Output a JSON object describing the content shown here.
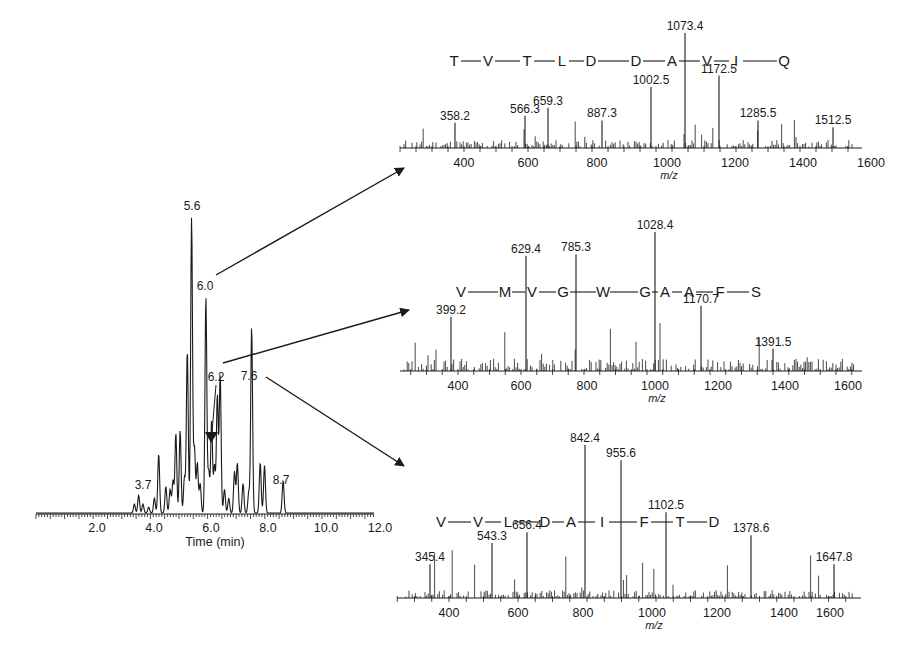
{
  "colors": {
    "ink": "#1a1a1a",
    "background": "#ffffff"
  },
  "chart_data": [
    {
      "id": "chromatogram",
      "type": "line",
      "title": "",
      "xlabel": "Time (min)",
      "ylabel": "",
      "xlim": [
        0,
        12.0
      ],
      "x_ticks": [
        "2.0",
        "4.0",
        "6.0",
        "8.0",
        "10.0",
        "12.0"
      ],
      "grid": false,
      "annotations": [
        "3.7",
        "5.6",
        "6.0",
        "6.2",
        "7.6",
        "8.7"
      ],
      "peaks": [
        {
          "t": 3.3,
          "h": 3
        },
        {
          "t": 3.45,
          "h": 6
        },
        {
          "t": 3.6,
          "h": 3
        },
        {
          "t": 3.8,
          "h": 2
        },
        {
          "t": 4.0,
          "h": 5
        },
        {
          "t": 4.15,
          "h": 20
        },
        {
          "t": 4.4,
          "h": 9
        },
        {
          "t": 4.55,
          "h": 8
        },
        {
          "t": 4.65,
          "h": 11
        },
        {
          "t": 4.75,
          "h": 27
        },
        {
          "t": 4.9,
          "h": 28
        },
        {
          "t": 5.05,
          "h": 12
        },
        {
          "t": 5.15,
          "h": 55
        },
        {
          "t": 5.3,
          "h": 100
        },
        {
          "t": 5.4,
          "h": 22
        },
        {
          "t": 5.5,
          "h": 17
        },
        {
          "t": 5.6,
          "h": 10
        },
        {
          "t": 5.8,
          "h": 73
        },
        {
          "t": 5.9,
          "h": 14
        },
        {
          "t": 6.0,
          "h": 31
        },
        {
          "t": 6.1,
          "h": 16
        },
        {
          "t": 6.2,
          "h": 40
        },
        {
          "t": 6.3,
          "h": 47
        },
        {
          "t": 6.45,
          "h": 8
        },
        {
          "t": 6.6,
          "h": 5
        },
        {
          "t": 6.8,
          "h": 14
        },
        {
          "t": 6.9,
          "h": 17
        },
        {
          "t": 7.1,
          "h": 10
        },
        {
          "t": 7.3,
          "h": 7
        },
        {
          "t": 7.4,
          "h": 63
        },
        {
          "t": 7.7,
          "h": 17
        },
        {
          "t": 7.85,
          "h": 16
        },
        {
          "t": 8.5,
          "h": 11
        }
      ]
    },
    {
      "id": "spectrum-top",
      "type": "bar",
      "xlabel": "m/z",
      "x_ticks": [
        "400",
        "600",
        "800",
        "1000",
        "1200",
        "1400",
        "1600"
      ],
      "sequence": [
        "T",
        "V",
        "T",
        "L",
        "D",
        "D",
        "A",
        "V",
        "I",
        "Q"
      ],
      "labeled_peaks": [
        {
          "mz": "358.2",
          "h": 0.22
        },
        {
          "mz": "566.3",
          "h": 0.28
        },
        {
          "mz": "659.3",
          "h": 0.35
        },
        {
          "mz": "887.3",
          "h": 0.24
        },
        {
          "mz": "1002.5",
          "h": 0.53
        },
        {
          "mz": "1073.4",
          "h": 1.0
        },
        {
          "mz": "1172.5",
          "h": 0.63
        },
        {
          "mz": "1285.5",
          "h": 0.24
        },
        {
          "mz": "1512.5",
          "h": 0.18
        }
      ]
    },
    {
      "id": "spectrum-middle",
      "type": "bar",
      "xlabel": "m/z",
      "x_ticks": [
        "400",
        "600",
        "800",
        "1000",
        "1200",
        "1400",
        "1600"
      ],
      "sequence": [
        "V",
        "M",
        "V",
        "G",
        "W",
        "G",
        "A",
        "A",
        "F",
        "S"
      ],
      "labeled_peaks": [
        {
          "mz": "399.2",
          "h": 0.39
        },
        {
          "mz": "629.4",
          "h": 0.83
        },
        {
          "mz": "785.3",
          "h": 0.84
        },
        {
          "mz": "1028.4",
          "h": 1.0
        },
        {
          "mz": "1170.7",
          "h": 0.47
        },
        {
          "mz": "1391.5",
          "h": 0.16
        }
      ]
    },
    {
      "id": "spectrum-bottom",
      "type": "bar",
      "xlabel": "m/z",
      "x_ticks": [
        "400",
        "600",
        "800",
        "1000",
        "1200",
        "1400",
        "1600"
      ],
      "sequence": [
        "V",
        "V",
        "L",
        "D",
        "A",
        "I",
        "F",
        "T",
        "D"
      ],
      "labeled_peaks": [
        {
          "mz": "345.4",
          "h": 0.22
        },
        {
          "mz": "543.3",
          "h": 0.36
        },
        {
          "mz": "656.4",
          "h": 0.43
        },
        {
          "mz": "842.4",
          "h": 1.0
        },
        {
          "mz": "955.6",
          "h": 0.9
        },
        {
          "mz": "1102.5",
          "h": 0.56
        },
        {
          "mz": "1378.6",
          "h": 0.41
        },
        {
          "mz": "1647.8",
          "h": 0.22
        }
      ]
    }
  ],
  "arrows": [
    {
      "from": "6.0",
      "to": "spectrum-top"
    },
    {
      "from": "6.2",
      "to": "spectrum-middle"
    },
    {
      "from": "7.6",
      "to": "spectrum-bottom"
    }
  ]
}
